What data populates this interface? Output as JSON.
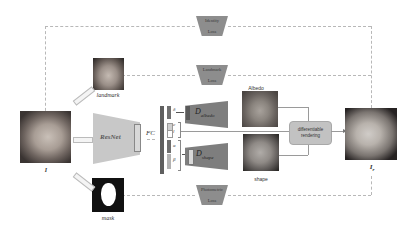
{
  "diagram": {
    "type": "pipeline",
    "nodes": {
      "input_image": {
        "caption": "I"
      },
      "landmark_image": {
        "caption": "landmark"
      },
      "mask_image": {
        "caption": "mask"
      },
      "encoder": {
        "label": "ResNet"
      },
      "fc": {
        "label": "FC"
      },
      "latent_codes": {
        "labels": [
          "δ",
          "c",
          "l",
          "α",
          "β"
        ]
      },
      "albedo_decoder": {
        "label": "D",
        "subscript": "albedo"
      },
      "shape_decoder": {
        "label": "D",
        "subscript": "shape"
      },
      "albedo_image": {
        "caption": "Albedo"
      },
      "shape_image": {
        "caption": "shape"
      },
      "renderer": {
        "label_line1": "differentiable",
        "label_line2": "rendering"
      },
      "output_image": {
        "caption": "I",
        "subscript": "r"
      }
    },
    "losses": {
      "identity": {
        "line1": "Identity",
        "line2": "Loss"
      },
      "landmark": {
        "line1": "Landmark",
        "line2": "Loss"
      },
      "photometric": {
        "line1": "Photometric",
        "line2": "Loss"
      }
    },
    "colors": {
      "loss_fill": "#8d8d8d",
      "encoder_fill": "#c8c8c8",
      "decoder_fill": "#7e7e7e",
      "renderer_fill": "#c2c2c2",
      "dashed_line": "#b8b8b8"
    }
  }
}
